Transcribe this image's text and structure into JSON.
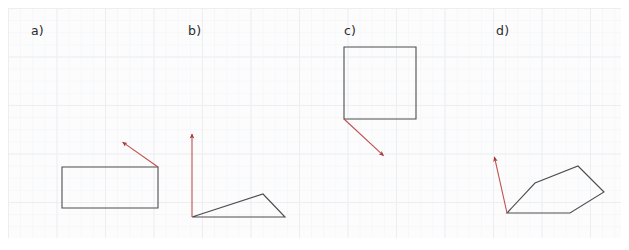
{
  "figure": {
    "title": "",
    "background_color": "#ffffff",
    "grid": {
      "visible": true,
      "minor_color": "#f6f7f9",
      "major_color": "#eceef2",
      "minor_size_px": 12.125,
      "major_size_px": 48.5,
      "area": {
        "x": 8,
        "y": 8,
        "width": 613,
        "height": 230
      }
    },
    "shape_stroke_color": "#4d4d4d",
    "vector_stroke_color": "#c0504d",
    "label_color": "#2b2b2b"
  },
  "panels": [
    {
      "id": "a",
      "label": "a)",
      "label_position": {
        "x": 35,
        "y": 33
      },
      "shape": {
        "name": "rectangle",
        "type": "polygon",
        "closed": true,
        "points": [
          [
            62,
            167
          ],
          [
            158,
            167
          ],
          [
            158,
            208
          ],
          [
            62,
            208
          ]
        ]
      },
      "vector": {
        "name": "arrow-a",
        "from": [
          158,
          167
        ],
        "to": [
          121,
          141
        ],
        "direction": "up-left",
        "anchor": "top-right-corner"
      }
    },
    {
      "id": "b",
      "label": "b)",
      "label_position": {
        "x": 192,
        "y": 33
      },
      "shape": {
        "name": "triangle",
        "type": "polygon",
        "closed": true,
        "points": [
          [
            192,
            217
          ],
          [
            263,
            194
          ],
          [
            285,
            217
          ]
        ]
      },
      "vector": {
        "name": "arrow-b",
        "from": [
          192,
          217
        ],
        "to": [
          192,
          132
        ],
        "direction": "up",
        "anchor": "bottom-left-vertex"
      }
    },
    {
      "id": "c",
      "label": "c)",
      "label_position": {
        "x": 348,
        "y": 33
      },
      "shape": {
        "name": "square",
        "type": "polygon",
        "closed": true,
        "points": [
          [
            344,
            47
          ],
          [
            416,
            47
          ],
          [
            416,
            119
          ],
          [
            344,
            119
          ]
        ]
      },
      "vector": {
        "name": "arrow-c",
        "from": [
          344,
          119
        ],
        "to": [
          385,
          157
        ],
        "direction": "down-right",
        "anchor": "bottom-left-corner"
      }
    },
    {
      "id": "d",
      "label": "d)",
      "label_position": {
        "x": 500,
        "y": 33
      },
      "shape": {
        "name": "pentagon",
        "type": "polygon",
        "closed": true,
        "points": [
          [
            507,
            213
          ],
          [
            535,
            183
          ],
          [
            578,
            166
          ],
          [
            604,
            192
          ],
          [
            570,
            213
          ]
        ]
      },
      "vector": {
        "name": "arrow-d",
        "from": [
          507,
          213
        ],
        "to": [
          494,
          155
        ],
        "direction": "up-left",
        "anchor": "bottom-left-vertex"
      }
    }
  ]
}
